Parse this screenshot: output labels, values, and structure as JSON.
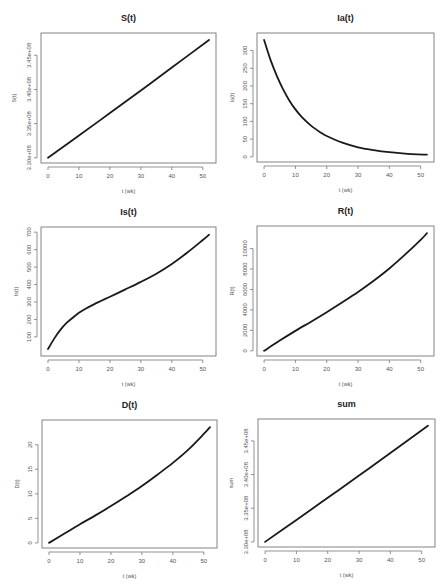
{
  "chart_data": [
    {
      "type": "line",
      "title": "S(t)",
      "xlabel": "t (wk)",
      "ylabel": "S(t)",
      "xlim": [
        0,
        52
      ],
      "ylim": [
        330000000.0,
        347500000.0
      ],
      "xticks": [
        0,
        10,
        20,
        30,
        40,
        50
      ],
      "yticks": [
        330000000.0,
        335000000.0,
        340000000.0,
        345000000.0
      ],
      "ytick_labels": [
        "3.30e+08",
        "3.35e+08",
        "3.40e+08",
        "3.45e+08"
      ],
      "x": [
        0,
        10,
        20,
        30,
        40,
        52
      ],
      "values": [
        330000000.0,
        333250000.0,
        336550000.0,
        339850000.0,
        343200000.0,
        347250000.0
      ],
      "frame": {
        "x0": 41,
        "y0": 33,
        "x1": 216,
        "y1": 163
      }
    },
    {
      "type": "line",
      "title": "Ia(t)",
      "xlabel": "t (wk)",
      "ylabel": "Ia(t)",
      "xlim": [
        0,
        52
      ],
      "ylim": [
        0,
        335
      ],
      "xticks": [
        0,
        10,
        20,
        30,
        40,
        50
      ],
      "yticks": [
        0,
        50,
        100,
        150,
        200,
        250,
        300
      ],
      "ytick_labels": [
        "0",
        "50",
        "100",
        "150",
        "200",
        "250",
        "300"
      ],
      "x": [
        0,
        2,
        4,
        6,
        8,
        10,
        12,
        15,
        18,
        20,
        25,
        30,
        35,
        40,
        45,
        52
      ],
      "values": [
        330,
        275,
        230,
        192,
        160,
        134,
        113,
        88,
        69,
        59,
        40,
        27,
        19,
        13,
        9,
        6
      ],
      "frame": {
        "x0": 257,
        "y0": 33,
        "x1": 434,
        "y1": 162
      }
    },
    {
      "type": "line",
      "title": "Is(t)",
      "xlabel": "t (wk)",
      "ylabel": "Is(t)",
      "xlim": [
        0,
        52
      ],
      "ylim": [
        20,
        700
      ],
      "xticks": [
        0,
        10,
        20,
        30,
        40,
        50
      ],
      "yticks": [
        100,
        200,
        300,
        400,
        500,
        600,
        700
      ],
      "ytick_labels": [
        "100",
        "200",
        "300",
        "400",
        "500",
        "600",
        "700"
      ],
      "x": [
        0,
        2,
        4,
        6,
        8,
        10,
        12,
        15,
        20,
        25,
        30,
        35,
        40,
        45,
        50,
        52
      ],
      "values": [
        30,
        90,
        140,
        180,
        210,
        238,
        260,
        288,
        330,
        372,
        415,
        462,
        518,
        583,
        655,
        685
      ],
      "frame": {
        "x0": 41,
        "y0": 227,
        "x1": 216,
        "y1": 356
      }
    },
    {
      "type": "line",
      "title": "R(t)",
      "xlabel": "t (wk)",
      "ylabel": "R(t)",
      "xlim": [
        0,
        52
      ],
      "ylim": [
        0,
        11700
      ],
      "xticks": [
        0,
        10,
        20,
        30,
        40,
        50
      ],
      "yticks": [
        0,
        2000,
        4000,
        6000,
        8000,
        10000
      ],
      "ytick_labels": [
        "0",
        "2000",
        "4000",
        "6000",
        "8000",
        "10000"
      ],
      "x": [
        0,
        5,
        10,
        15,
        20,
        25,
        30,
        35,
        40,
        45,
        50,
        52
      ],
      "values": [
        0,
        1000,
        1950,
        2850,
        3780,
        4750,
        5750,
        6850,
        8050,
        9400,
        10850,
        11500
      ],
      "frame": {
        "x0": 257,
        "y0": 226,
        "x1": 434,
        "y1": 356
      }
    },
    {
      "type": "line",
      "title": "D(t)",
      "xlabel": "t (wk)",
      "ylabel": "D(t)",
      "xlim": [
        0,
        52
      ],
      "ylim": [
        0,
        24
      ],
      "xticks": [
        0,
        10,
        20,
        30,
        40,
        50
      ],
      "yticks": [
        0,
        5,
        10,
        15,
        20
      ],
      "ytick_labels": [
        "0",
        "5",
        "10",
        "15",
        "20"
      ],
      "x": [
        0,
        5,
        10,
        15,
        20,
        25,
        30,
        35,
        40,
        45,
        50,
        52
      ],
      "values": [
        0,
        1.9,
        3.8,
        5.6,
        7.5,
        9.5,
        11.6,
        13.9,
        16.3,
        19.0,
        22.2,
        23.6
      ],
      "frame": {
        "x0": 42,
        "y0": 420,
        "x1": 217,
        "y1": 548
      }
    },
    {
      "type": "line",
      "title": "sum",
      "xlabel": "t (wk)",
      "ylabel": "sum",
      "xlim": [
        0,
        52
      ],
      "ylim": [
        330000000.0,
        347500000.0
      ],
      "xticks": [
        0,
        10,
        20,
        30,
        40,
        50
      ],
      "yticks": [
        330000000.0,
        335000000.0,
        340000000.0,
        345000000.0
      ],
      "ytick_labels": [
        "3.30e+08",
        "3.35e+08",
        "3.40e+08",
        "3.45e+08"
      ],
      "x": [
        0,
        10,
        20,
        30,
        40,
        52
      ],
      "values": [
        330000000.0,
        333250000.0,
        336550000.0,
        339850000.0,
        343200000.0,
        347250000.0
      ],
      "frame": {
        "x0": 258,
        "y0": 419,
        "x1": 435,
        "y1": 547
      }
    }
  ],
  "colors": {
    "curve": "#1a1a1a",
    "frame": "#777777",
    "background": "#ffffff"
  }
}
